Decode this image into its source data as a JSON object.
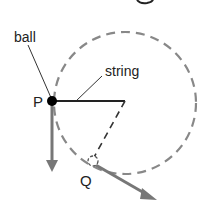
{
  "diagram": {
    "labels": {
      "ball": "ball",
      "string": "string",
      "point_p": "P",
      "point_q": "Q"
    },
    "colors": {
      "circle": "#888888",
      "arrow": "#777777",
      "string": "#222222",
      "ball": "#000000"
    }
  }
}
